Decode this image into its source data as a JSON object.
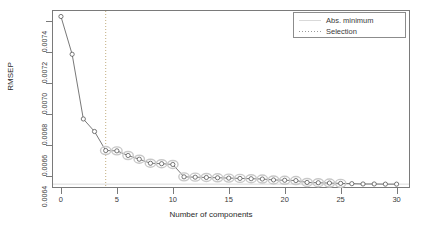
{
  "chart_data": {
    "type": "line",
    "title": "",
    "xlabel": "Number of components",
    "ylabel": "RMSEP",
    "xlim": [
      -0.8,
      31.2
    ],
    "ylim": [
      0.00632,
      0.00747
    ],
    "xticks": [
      0,
      5,
      10,
      15,
      20,
      25,
      30
    ],
    "xtick_labels": [
      "0",
      "5",
      "10",
      "15",
      "20",
      "25",
      "30"
    ],
    "yticks": [
      0.0064,
      0.0066,
      0.0068,
      0.007,
      0.0072,
      0.0074
    ],
    "ytick_labels": [
      "0.0064",
      "0.0066",
      "0.0068",
      "0.0070",
      "0.0072",
      "0.0074"
    ],
    "grid": false,
    "x": [
      0,
      1,
      2,
      3,
      4,
      5,
      6,
      7,
      8,
      9,
      10,
      11,
      12,
      13,
      14,
      15,
      16,
      17,
      18,
      19,
      20,
      21,
      22,
      23,
      24,
      25,
      26,
      27,
      28,
      29,
      30
    ],
    "values": [
      0.007428,
      0.007184,
      0.006766,
      0.006685,
      0.006562,
      0.00656,
      0.00653,
      0.006506,
      0.00648,
      0.006477,
      0.006472,
      0.006392,
      0.00639,
      0.006388,
      0.006386,
      0.006384,
      0.006382,
      0.00638,
      0.006378,
      0.006372,
      0.00637,
      0.006368,
      0.006356,
      0.006354,
      0.006352,
      0.00635,
      0.006348,
      0.006346,
      0.006346,
      0.006345,
      0.006345
    ],
    "marker": "open-circle",
    "highlighted_points": [
      4,
      5,
      6,
      7,
      8,
      9,
      10,
      11,
      12,
      13,
      14,
      15,
      16,
      17,
      18,
      19,
      20,
      21,
      22,
      23,
      24,
      25
    ],
    "selection_line_x": 4,
    "line_color": "#555555",
    "marker_color": "#555555",
    "highlight_color": "#c8c8c8",
    "selection_color": "#b9a06a",
    "absmin_color": "#d9d9d9",
    "frame_color": "#7a7a7a",
    "legend": {
      "position": "top-right",
      "entries": [
        {
          "label": "Abs. minimum",
          "style": "solid",
          "color": "#d9d9d9"
        },
        {
          "label": "Selection",
          "style": "dotted",
          "color": "#9a9a9a"
        }
      ]
    }
  }
}
